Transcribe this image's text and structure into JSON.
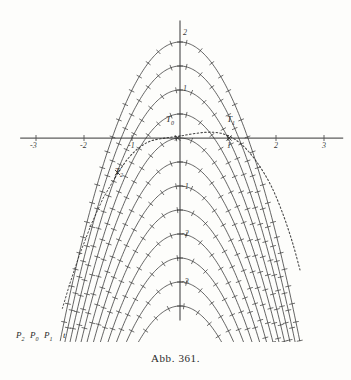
{
  "figure": {
    "caption": "Abb. 361.",
    "background_color": "#fdfdfb",
    "ink_color": "#2f2f2f",
    "axis_color": "#555555"
  },
  "axes": {
    "x_label_values": [
      "-3",
      "-2",
      "-1",
      "1",
      "2",
      "3"
    ],
    "y_label_values": [
      "2",
      "1",
      "-1",
      "-2",
      "-3"
    ],
    "x_range": [
      -3.3,
      3.3
    ],
    "y_range": [
      -3.6,
      2.4
    ],
    "origin_px": [
      180,
      138
    ],
    "unit_px": 48,
    "grid": false
  },
  "point_labels": [
    {
      "name": "T0",
      "text": "T",
      "subscript": "0",
      "x_px": 168,
      "y_px": 120
    },
    {
      "name": "T1",
      "text": "T",
      "subscript": "1",
      "x_px": 229,
      "y_px": 120
    },
    {
      "name": "T2",
      "text": "T",
      "subscript": "2",
      "x_px": 117,
      "y_px": 172
    },
    {
      "name": "P2",
      "text": "P",
      "subscript": "2",
      "x_px": 18,
      "y_px": 336
    },
    {
      "name": "P0",
      "text": "P",
      "subscript": "0",
      "x_px": 32,
      "y_px": 336
    },
    {
      "name": "P1",
      "text": "P",
      "subscript": "1",
      "x_px": 46,
      "y_px": 336
    },
    {
      "name": "t",
      "text": "t",
      "subscript": "",
      "x_px": 64,
      "y_px": 336
    }
  ],
  "chart_data": {
    "type": "line",
    "title": "Abb. 361.",
    "xlabel": "",
    "ylabel": "",
    "xlim": [
      -3.3,
      3.3
    ],
    "ylim": [
      -3.6,
      2.4
    ],
    "grid": false,
    "family": {
      "equation": "y = -x^2 + c",
      "parameter_name": "c",
      "parameter_values": [
        2.0,
        1.5,
        1.0,
        0.5,
        0.0,
        -0.5,
        -1.0,
        -1.5,
        -2.0,
        -2.5,
        -3.0,
        -3.5
      ]
    },
    "series": [
      {
        "name": "dotted-orthogonal-trajectory",
        "style": "dotted",
        "points": [
          [
            -1.35,
            -0.82
          ],
          [
            -1.1,
            -0.45
          ],
          [
            -0.85,
            -0.2
          ],
          [
            -0.6,
            -0.06
          ],
          [
            -0.3,
            0.0
          ],
          [
            0.0,
            0.04
          ],
          [
            0.35,
            0.1
          ],
          [
            0.7,
            0.12
          ],
          [
            1.0,
            0.05
          ],
          [
            1.3,
            -0.15
          ],
          [
            1.6,
            -0.5
          ],
          [
            1.9,
            -1.0
          ],
          [
            2.15,
            -1.6
          ],
          [
            2.35,
            -2.2
          ],
          [
            2.5,
            -2.75
          ]
        ]
      }
    ],
    "marked_points": [
      {
        "label": "T0",
        "x": -0.05,
        "y": 0.0
      },
      {
        "label": "T1",
        "x": 1.02,
        "y": 0.0
      },
      {
        "label": "T2",
        "x": -1.3,
        "y": -0.72
      }
    ]
  }
}
